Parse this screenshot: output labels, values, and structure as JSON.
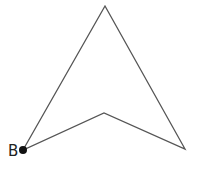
{
  "diagram": {
    "shape": "concave quadrilateral (arrowhead)",
    "stroke_color": "#555555",
    "vertices": [
      {
        "x": 23,
        "y": 150
      },
      {
        "x": 105,
        "y": 6
      },
      {
        "x": 185,
        "y": 149
      },
      {
        "x": 104,
        "y": 113
      }
    ],
    "point": {
      "label": "B",
      "x": 23,
      "y": 150,
      "color": "#111111"
    }
  }
}
